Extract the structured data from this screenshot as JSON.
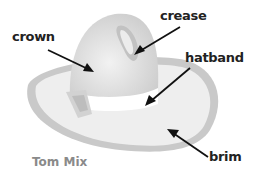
{
  "diagram": {
    "title": "Tom Mix",
    "labels": {
      "crown": "crown",
      "crease": "crease",
      "hatband": "hatband",
      "brim": "brim"
    },
    "colors": {
      "brim_outer": "#cfcfcf",
      "brim_inner": "#ededed",
      "crown": "#dcdcdc",
      "hatband": "#ffffff",
      "arrow": "#111111",
      "caption": "#8a8a8a"
    }
  }
}
